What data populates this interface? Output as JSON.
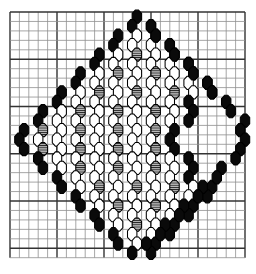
{
  "document": {
    "title": "Beadwork Diamond Pattern Chart",
    "kind": "bead-weaving-chart"
  },
  "colors": {
    "background": "#ffffff",
    "grid_minor": "#8f8f8f",
    "grid_major": "#333333",
    "bead_outline": "#000000",
    "bead_black": "#0a0a0a",
    "bead_white": "#ffffff",
    "bead_hatch_fill": "#bdbdbd",
    "bead_hatch_line": "#1a1a1a"
  },
  "grid": {
    "x0": 10,
    "y0": 12,
    "cols": 25,
    "rows": 26,
    "cell_w": 9.4,
    "cell_h": 9.45,
    "major_every": 5,
    "minor_width": 0.8,
    "major_width": 1.4
  },
  "bead": {
    "width": 9.4,
    "height": 13.2,
    "row_pitch": 9.45,
    "col_pitch": 9.4,
    "hatch_spacing": 2.2
  },
  "legend": {
    "symbols": [
      {
        "key": "K",
        "name": "black-bead",
        "label": "Black bead"
      },
      {
        "key": "W",
        "name": "white-bead",
        "label": "White / clear bead"
      },
      {
        "key": "H",
        "name": "hatched-bead",
        "label": "Grey hatched bead"
      },
      {
        "key": ".",
        "name": "empty-cell",
        "label": "No bead"
      }
    ]
  },
  "chart_data": {
    "type": "heatmap",
    "title": "Beadwork Diamond Pattern Chart",
    "subtitle": "",
    "xlabel": "",
    "ylabel": "",
    "grid": true,
    "legend_position": "none",
    "categories": [
      "K",
      "W",
      "H",
      "."
    ],
    "value_map": {
      ".": 0,
      "W": 1,
      "H": 2,
      "K": 3
    },
    "rows": 26,
    "cols": 25,
    "row_offsets": [
      0.0,
      0.5,
      0.0,
      0.5,
      0.0,
      0.5,
      0.0,
      0.5,
      0.0,
      0.5,
      0.0,
      0.5,
      0.0,
      0.5,
      0.0,
      0.5,
      0.0,
      0.5,
      0.0,
      0.5,
      0.0,
      0.5,
      0.0,
      0.5,
      0.0,
      0.5
    ],
    "cells": [
      ".............K...........",
      "............K.K..........",
      "...........K.W.K.........",
      "..........K.W.W.K........",
      ".........K.W.H.W.K.......",
      "........K.W.W.W.W.K......",
      ".......K.W.H.W.H.W.K.....",
      "......K.W.W.W.W.W.W.K....",
      ".....K.W.H.W.H.W.H.W.K...",
      "....K.W.W.W.W.W.W.K......",
      "...K.W.H.W.H.W.H.W.K.....",
      "..K.W.W.W.W.W.W.W.K......",
      ".K.H.W.H.W.H.W.H.K.......",
      "K.W.W.W.W.W.W.W.K........",
      ".K.H.W.H.W.H.W.H.K.......",
      "..K.W.W.W.W.W.W.W.K......",
      "...K.W.H.W.H.W.H.W.K.....",
      "....K.W.W.W.W.W.W.K......",
      ".....K.W.H.W.H.W.H.W.K...",
      "......K.W.W.W.W.W.W.K....",
      ".......K.W.H.W.H.W.K.....",
      "........K.W.W.W.W.K......",
      ".........K.W.H.W.K.......",
      "..........K.W.W.K........",
      "...........K.W.K.........",
      "............K.K.........."
    ],
    "outline_right": {
      "description": "hollow right lobe of the diamond bounded by black beads",
      "upper_edge": [
        [
          14,
          1
        ],
        [
          15,
          2
        ],
        [
          16,
          3
        ],
        [
          17,
          4
        ],
        [
          18,
          5
        ],
        [
          19,
          6
        ],
        [
          20,
          7
        ],
        [
          21,
          8
        ],
        [
          22,
          9
        ],
        [
          23,
          10
        ],
        [
          24,
          11
        ],
        [
          24,
          12
        ]
      ],
      "lower_edge": [
        [
          24,
          13
        ],
        [
          24,
          14
        ],
        [
          23,
          15
        ],
        [
          22,
          16
        ],
        [
          21,
          17
        ],
        [
          20,
          18
        ],
        [
          19,
          19
        ],
        [
          18,
          20
        ],
        [
          17,
          21
        ],
        [
          16,
          22
        ],
        [
          15,
          23
        ],
        [
          14,
          24
        ]
      ]
    }
  }
}
